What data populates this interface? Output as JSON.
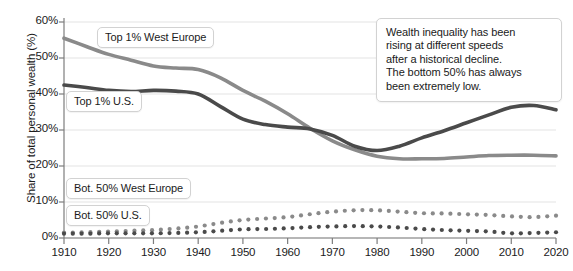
{
  "chart_data": {
    "type": "line",
    "title": "",
    "xlabel": "",
    "ylabel": "Share of total personal wealth (%)",
    "xlim": [
      1910,
      2020
    ],
    "ylim": [
      0,
      60
    ],
    "grid": true,
    "legend_position": "inline-labels",
    "x_ticks": [
      "1910",
      "1920",
      "1930",
      "1940",
      "1950",
      "1960",
      "1970",
      "1980",
      "1990",
      "2000",
      "2010",
      "2020"
    ],
    "y_ticks": [
      "0%",
      "10%",
      "20%",
      "30%",
      "40%",
      "50%",
      "60%"
    ],
    "x": [
      1910,
      1915,
      1920,
      1925,
      1930,
      1935,
      1940,
      1945,
      1950,
      1955,
      1960,
      1965,
      1970,
      1975,
      1980,
      1985,
      1990,
      1995,
      2000,
      2005,
      2010,
      2015,
      2020
    ],
    "series": [
      {
        "name": "Top 1% West Europe",
        "style": "solid",
        "color": "#8a8a8a",
        "values": [
          55.5,
          53.2,
          51.0,
          49.4,
          47.8,
          47.2,
          46.8,
          44.5,
          41.0,
          38.0,
          34.5,
          30.5,
          27.0,
          24.5,
          22.7,
          22.0,
          22.0,
          22.1,
          22.5,
          22.9,
          23.0,
          23.0,
          22.8
        ]
      },
      {
        "name": "Top 1% U.S.",
        "style": "solid",
        "color": "#4a4a4a",
        "values": [
          42.5,
          41.8,
          41.0,
          40.7,
          41.0,
          40.8,
          40.0,
          36.5,
          33.0,
          31.5,
          30.8,
          30.3,
          28.5,
          25.5,
          24.3,
          25.5,
          27.8,
          29.8,
          32.0,
          34.2,
          36.3,
          36.8,
          35.6
        ]
      },
      {
        "name": "Bot. 50% West Europe",
        "style": "dotted",
        "color": "#8a8a8a",
        "values": [
          1.5,
          1.6,
          1.8,
          2.0,
          2.2,
          2.6,
          3.2,
          4.2,
          5.0,
          5.4,
          5.8,
          6.6,
          7.3,
          7.7,
          7.7,
          7.3,
          6.9,
          6.8,
          6.6,
          6.4,
          6.0,
          5.8,
          6.2
        ]
      },
      {
        "name": "Bot. 50% U.S.",
        "style": "dotted",
        "color": "#4a4a4a",
        "values": [
          1.2,
          1.2,
          1.3,
          1.3,
          1.3,
          1.4,
          1.6,
          2.0,
          2.4,
          2.5,
          2.7,
          3.0,
          3.2,
          3.3,
          3.2,
          2.9,
          2.5,
          2.2,
          2.0,
          1.8,
          1.3,
          1.4,
          1.6
        ]
      }
    ],
    "series_labels": [
      {
        "text": "Top 1% West Europe",
        "left": 97,
        "top": 27
      },
      {
        "text": "Top 1% U.S.",
        "left": 66,
        "top": 91
      },
      {
        "text": "Bot. 50% West Europe",
        "left": 66,
        "top": 178
      },
      {
        "text": "Bot. 50% U.S.",
        "left": 66,
        "top": 205
      }
    ],
    "annotation": {
      "lines": [
        "Wealth inequality has been",
        "rising at different speeds",
        "after a historical decline.",
        "The bottom 50% has always",
        "been extremely low."
      ]
    }
  }
}
